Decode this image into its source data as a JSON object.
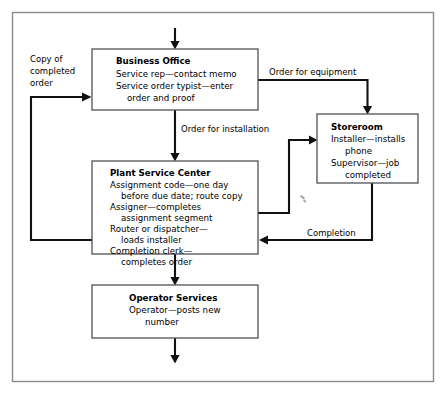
{
  "diagram": {
    "type": "flowchart",
    "frame": {
      "border_color": "#8a8a8a"
    },
    "nodes": [
      {
        "id": "business-office",
        "title": "Business Office",
        "lines": [
          {
            "text": "Service rep—contact memo",
            "indent": 0
          },
          {
            "text": "Service order typist—enter",
            "indent": 0
          },
          {
            "text": "order and proof",
            "indent": 1
          }
        ]
      },
      {
        "id": "plant-service-center",
        "title": "Plant Service Center",
        "lines": [
          {
            "text": "Assignment code—one day",
            "indent": 0
          },
          {
            "text": "before due date; route copy",
            "indent": 1
          },
          {
            "text": "Assigner—completes",
            "indent": 0
          },
          {
            "text": "assignment segment",
            "indent": 1
          },
          {
            "text": "Router or dispatcher—",
            "indent": 0
          },
          {
            "text": "loads installer",
            "indent": 1
          },
          {
            "text": "Completion clerk—",
            "indent": 0
          },
          {
            "text": "completes order",
            "indent": 1
          }
        ]
      },
      {
        "id": "storeroom",
        "title": "Storeroom",
        "lines": [
          {
            "text": "Installer—installs",
            "indent": 0
          },
          {
            "text": "phone",
            "indent": 1
          },
          {
            "text": "Supervisor—job",
            "indent": 0
          },
          {
            "text": "completed",
            "indent": 1
          }
        ]
      },
      {
        "id": "operator-services",
        "title": "Operator Services",
        "lines": [
          {
            "text": "Operator—posts new",
            "indent": 0
          },
          {
            "text": "number",
            "indent": 1
          }
        ]
      }
    ],
    "edge_labels": {
      "copy_of_completed_order": [
        "Copy of",
        "completed",
        "order"
      ],
      "order_for_equipment": "Order for equipment",
      "order_for_installation": "Order for installation",
      "completion": "Completion"
    }
  }
}
